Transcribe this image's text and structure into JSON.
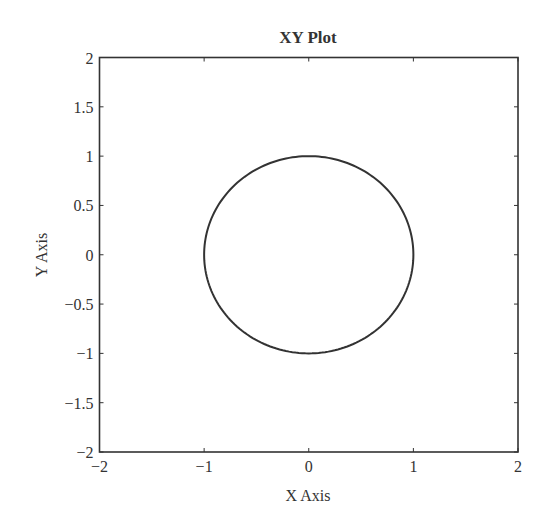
{
  "chart_data": {
    "type": "line",
    "title": "XY Plot",
    "xlabel": "X Axis",
    "ylabel": "Y Axis",
    "xlim": [
      -2,
      2
    ],
    "ylim": [
      -2,
      2
    ],
    "xticks": [
      -2,
      -1,
      0,
      1,
      2
    ],
    "xtick_labels": [
      "−2",
      "−1",
      "0",
      "1",
      "2"
    ],
    "yticks": [
      -2,
      -1.5,
      -1,
      -0.5,
      0,
      0.5,
      1,
      1.5,
      2
    ],
    "ytick_labels": [
      "−2",
      "−1.5",
      "−1",
      "−0.5",
      "0",
      "0.5",
      "1",
      "1.5",
      "2"
    ],
    "grid": false,
    "legend": null,
    "series": [
      {
        "name": "unit circle",
        "description": "x = cos(t), y = sin(t), t in [0, 2π]",
        "center": [
          0,
          0
        ],
        "radius": 1,
        "color": "#333333"
      }
    ]
  },
  "colors": {
    "axes": "#333333",
    "line": "#333333",
    "background": "#ffffff"
  }
}
